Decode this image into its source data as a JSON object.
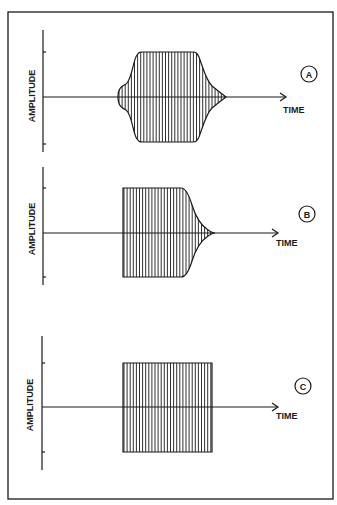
{
  "figure": {
    "stroke_color": "#1a1a1a",
    "background": "#ffffff",
    "frame": {
      "x": 8,
      "y": 12,
      "w": 325,
      "h": 487
    }
  },
  "panels": [
    {
      "id": "A",
      "label": "A",
      "y_axis_label": "AMPLITUDE",
      "x_axis_label": "TIME",
      "axis": {
        "x": 43,
        "y_top": 30,
        "y_bottom": 152,
        "center_y": 97,
        "arrow_end_x": 286,
        "tick_top": 52,
        "tick_bottom": 144
      },
      "label_circle": {
        "cx": 309,
        "cy": 74,
        "r": 8
      },
      "time_label_pos": {
        "x": 283,
        "y": 113
      },
      "amp_label_pos": {
        "x": 35,
        "y": 96
      },
      "envelope_description": "slow attack with initial bump, sustain, gradual decay",
      "envelope_path": "M118,97 C118,88 122,86 126,84 C132,80 133,60 137,55 C139,52 140,52 143,52 L193,52 C196,52 197,53 199,57 C203,68 206,80 212,86 C218,91 222,94 226,97 C222,100 218,103 212,108 C206,114 203,126 199,137 C197,141 196,142 193,142 L143,142 C140,142 139,142 137,139 C133,134 132,114 126,110 C122,108 118,106 118,97 Z",
      "hatch": {
        "x_start": 119,
        "x_end": 226,
        "spacing": 3.1
      }
    },
    {
      "id": "B",
      "label": "B",
      "y_axis_label": "AMPLITUDE",
      "x_axis_label": "TIME",
      "axis": {
        "x": 43,
        "y_top": 167,
        "y_bottom": 285,
        "center_y": 233,
        "arrow_end_x": 278,
        "tick_top": 188,
        "tick_bottom": 277
      },
      "label_circle": {
        "cx": 307,
        "cy": 214,
        "r": 8
      },
      "time_label_pos": {
        "x": 276,
        "y": 246
      },
      "amp_label_pos": {
        "x": 35,
        "y": 229
      },
      "envelope_description": "instant attack, sustain, exponential decay",
      "envelope_path": "M123,188 L181,188 C186,188 189,195 192,205 C196,218 202,226 208,230 C211,232 213,233 215,233 C213,233 211,234 208,236 C202,240 196,248 192,261 C189,271 186,277 181,277 L123,277 Z",
      "hatch": {
        "x_start": 124,
        "x_end": 215,
        "spacing": 3.1
      }
    },
    {
      "id": "C",
      "label": "C",
      "y_axis_label": "AMPLITUDE",
      "x_axis_label": "TIME",
      "axis": {
        "x": 42,
        "y_top": 336,
        "y_bottom": 470,
        "center_y": 407,
        "arrow_end_x": 278,
        "tick_top": 363,
        "tick_bottom": 452
      },
      "label_circle": {
        "cx": 303,
        "cy": 386,
        "r": 8
      },
      "time_label_pos": {
        "x": 276,
        "y": 419
      },
      "amp_label_pos": {
        "x": 33,
        "y": 405
      },
      "envelope_description": "instant attack, sustain, instant release (rectangular)",
      "envelope_path": "M123,363 L212,363 L212,452 L123,452 Z",
      "hatch": {
        "x_start": 124,
        "x_end": 212,
        "spacing": 3.1
      }
    }
  ]
}
